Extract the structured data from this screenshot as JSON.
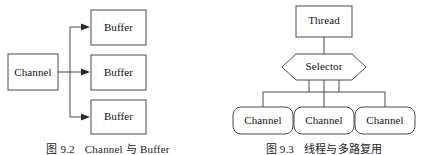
{
  "page": {
    "background": "#ffffff",
    "line_color": "#4a4a4a",
    "text_color": "#111111",
    "width": 432,
    "height": 155
  },
  "figures": [
    {
      "id": "figure-left",
      "caption_number": "图 9.2",
      "caption_title": "Channel 与 Buffer",
      "nodes": {
        "source": "Channel",
        "targets": [
          "Buffer",
          "Buffer",
          "Buffer"
        ]
      }
    },
    {
      "id": "figure-right",
      "caption_number": "图 9.3",
      "caption_title": "线程与多路复用",
      "nodes": {
        "top": "Thread",
        "middle": "Selector",
        "bottom": [
          "Channel",
          "Channel",
          "Channel"
        ]
      }
    }
  ]
}
